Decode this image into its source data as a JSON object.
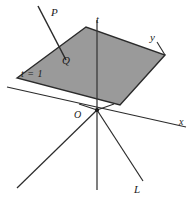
{
  "figure": {
    "background_color": "#ffffff",
    "plane_fill_color": "#9a9a9a",
    "line_color": "#2b2b2b",
    "label_color": "#1a1a1a"
  },
  "labels": {
    "point_P": "P",
    "point_Q": "Q",
    "axis_t": "t",
    "axis_x": "x",
    "axis_y": "y",
    "origin": "O",
    "plane_equation": "t = 1",
    "line_L": "L"
  },
  "geometry": {
    "plane_polygon": "17,78 86,27 165,55 120,105",
    "axis_t_line": {
      "x1": 97,
      "y1": 20,
      "x2": 97,
      "y2": 190
    },
    "axis_x_line": {
      "x1": 7,
      "y1": 87,
      "x2": 186,
      "y2": 127
    },
    "axis_y_segment": {
      "x1": 157,
      "y1": 42,
      "x2": 165,
      "y2": 55
    },
    "line_P_through_plane": {
      "x1": 38,
      "y1": 6,
      "x2": 65,
      "y2": 58
    },
    "line_L": {
      "x1": 97,
      "y1": 110,
      "x2": 143,
      "y2": 181
    },
    "line_lower_left": {
      "x1": 97,
      "y1": 110,
      "x2": 17,
      "y2": 188
    },
    "origin_point": {
      "x": 97,
      "y": 110
    }
  }
}
